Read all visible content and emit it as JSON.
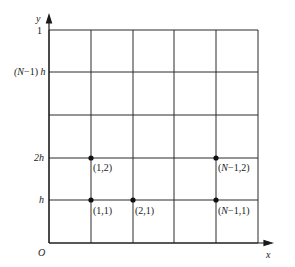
{
  "diagram": {
    "axes": {
      "x_label": "x",
      "y_label": "y",
      "origin_label": "O"
    },
    "y_ticks": [
      {
        "label": "1",
        "y": 30
      },
      {
        "label": "(N−1) h",
        "y": 72
      },
      {
        "label": "2h",
        "y": 158
      },
      {
        "label": "h",
        "y": 200
      }
    ],
    "grid": {
      "x_lines": [
        49,
        91,
        133,
        174,
        216,
        258
      ],
      "y_lines": [
        30,
        72,
        115,
        158,
        200,
        243
      ]
    },
    "nodes": [
      {
        "label": "(1,2)",
        "x": 91,
        "y": 158
      },
      {
        "label": "(1,1)",
        "x": 91,
        "y": 200
      },
      {
        "label": "(2,1)",
        "x": 133,
        "y": 200
      },
      {
        "label": "(N−1,2)",
        "x": 216,
        "y": 158
      },
      {
        "label": "(N−1,1)",
        "x": 216,
        "y": 200
      }
    ],
    "line_color": "#2a2a2a"
  }
}
